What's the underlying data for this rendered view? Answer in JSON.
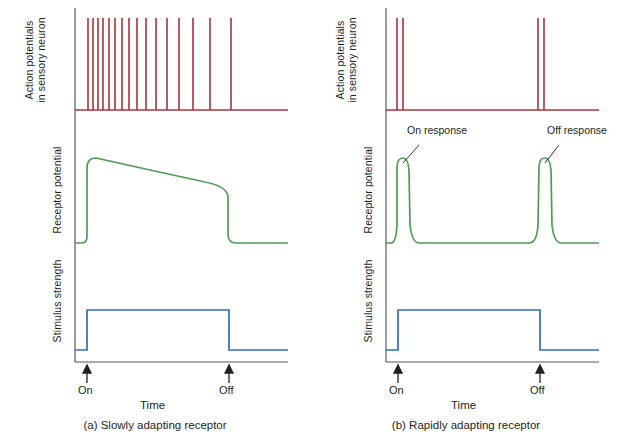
{
  "figure": {
    "type": "physiology-trace-diagram",
    "panels": [
      {
        "id": "a",
        "caption": "(a) Slowly adapting receptor",
        "time_axis": {
          "label": "Time",
          "markers": [
            {
              "name": "On",
              "label": "On",
              "x": 87
            },
            {
              "name": "Off",
              "label": "Off",
              "x": 229
            }
          ]
        },
        "traces": [
          {
            "name": "action-potentials",
            "label_lines": [
              "Action potentials",
              "in sensory neuron"
            ],
            "color": "#a6333f",
            "type": "spike-train",
            "description": "High initial firing rate that gradually slows during sustained stimulus",
            "spike_x": [
              88,
              93,
              98,
              103,
              109,
              115,
              122,
              129,
              137,
              146,
              156,
              167,
              179,
              193,
              210,
              231
            ],
            "baseline_y": 110,
            "spike_top_y": 18
          },
          {
            "name": "receptor-potential",
            "label_lines": [
              "Receptor potential"
            ],
            "color": "#4f9a55",
            "type": "step-with-slow-decay",
            "description": "Rapid rise to peak then slow decline while stimulus is maintained, falling to baseline at stimulus off",
            "baseline_y": 243,
            "peak_y": 158,
            "decay_end_y": 188,
            "rise_x": 87,
            "fall_x": 229
          },
          {
            "name": "stimulus-strength",
            "label_lines": [
              "Stimulus strength"
            ],
            "color": "#2f6fb5",
            "type": "square-pulse",
            "description": "Constant stimulus from On to Off",
            "baseline_y": 350,
            "top_y": 310,
            "rise_x": 87,
            "fall_x": 229
          }
        ],
        "annotations": []
      },
      {
        "id": "b",
        "caption": "(b) Rapidly adapting receptor",
        "time_axis": {
          "label": "Time",
          "markers": [
            {
              "name": "On",
              "label": "On",
              "x": 87
            },
            {
              "name": "Off",
              "label": "Off",
              "x": 229
            }
          ]
        },
        "traces": [
          {
            "name": "action-potentials",
            "label_lines": [
              "Action potentials",
              "in sensory neuron"
            ],
            "color": "#a6333f",
            "type": "spike-train",
            "description": "Brief burst at stimulus onset and a second brief burst at stimulus offset",
            "spike_x": [
              86,
              92,
              227,
              233
            ],
            "baseline_y": 110,
            "spike_top_y": 18
          },
          {
            "name": "receptor-potential",
            "label_lines": [
              "Receptor potential"
            ],
            "color": "#4f9a55",
            "type": "transient-peaks",
            "description": "Sharp transient depolarization at stimulus onset and at stimulus offset, returning to baseline in between",
            "baseline_y": 243,
            "peak_y": 158,
            "peak_x": [
              89,
              231
            ]
          },
          {
            "name": "stimulus-strength",
            "label_lines": [
              "Stimulus strength"
            ],
            "color": "#2f6fb5",
            "type": "square-pulse",
            "description": "Constant stimulus from On to Off",
            "baseline_y": 350,
            "top_y": 310,
            "rise_x": 87,
            "fall_x": 229
          }
        ],
        "annotations": [
          {
            "name": "on-response",
            "label": "On response",
            "text_x": 96,
            "text_y": 131,
            "point_x": 92,
            "point_y": 160
          },
          {
            "name": "off-response",
            "label": "Off response",
            "text_x": 236,
            "text_y": 131,
            "point_x": 234,
            "point_y": 160
          }
        ]
      }
    ],
    "colors": {
      "spike": "#a6333f",
      "receptor": "#4f9a55",
      "stimulus": "#2f6fb5",
      "axis": "#58595b",
      "text": "#231f20",
      "background": "#ffffff"
    }
  }
}
